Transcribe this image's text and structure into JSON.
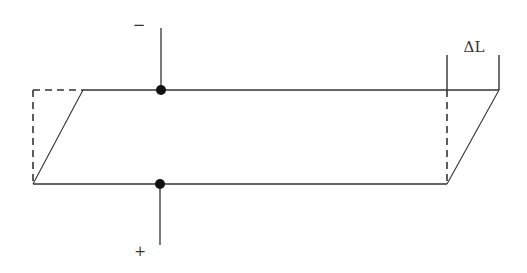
{
  "diagram": {
    "labels": {
      "negative_terminal": "−",
      "positive_terminal": "+",
      "displacement": "ΔL"
    },
    "colors": {
      "stroke": "#333333",
      "dot": "#111111",
      "background": "#ffffff"
    },
    "original_shape": {
      "style": "dashed",
      "left_x": 33,
      "right_x": 447,
      "top_y": 90,
      "bottom_y": 184
    },
    "deformed_shape": {
      "style": "solid",
      "top_left": [
        83,
        90
      ],
      "top_right": [
        499,
        90
      ],
      "bottom_right": [
        447,
        184
      ],
      "bottom_left": [
        33,
        184
      ]
    },
    "electrodes": {
      "top": {
        "dot": [
          161,
          90
        ],
        "lead_end_y": 28
      },
      "bottom": {
        "dot": [
          160,
          184
        ],
        "lead_end_y": 245
      }
    },
    "dimension": {
      "left_tick_x": 447,
      "right_tick_x": 499,
      "tick_top_y": 55
    }
  }
}
